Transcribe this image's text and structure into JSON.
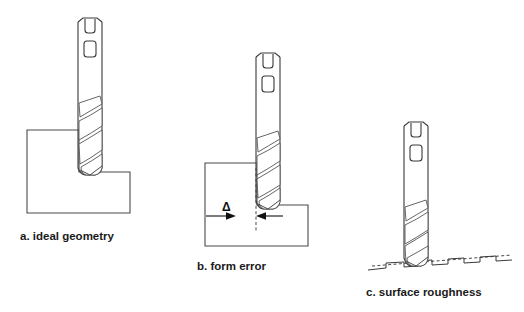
{
  "figure": {
    "background_color": "#ffffff",
    "line_color": "#4a4a4a",
    "text_color": "#1a1a1a"
  },
  "panels": [
    {
      "id": "a",
      "caption": "a. ideal geometry",
      "caption_x": 20,
      "caption_y": 240,
      "tool": {
        "name": "end-mill-cutter",
        "shank_x": 78,
        "shank_top": 18,
        "shank_width": 24,
        "flute_count": 3,
        "tip_y": 170
      },
      "workpiece": {
        "name": "stepped-workpiece",
        "shape": "L-step",
        "left": 27,
        "top": 130,
        "right": 130,
        "bottom": 213,
        "step_x": 79,
        "step_y": 172
      }
    },
    {
      "id": "b",
      "caption": "b. form error",
      "caption_x": 197,
      "caption_y": 270,
      "annotation": {
        "symbol": "Δ",
        "name": "form-error-delta",
        "symbol_x": 222,
        "symbol_y": 207,
        "dim_line_y": 216,
        "dim_left_x": 206,
        "dim_right_x": 283,
        "reference_line_x": 256
      },
      "tool": {
        "name": "end-mill-cutter",
        "shank_x": 256,
        "shank_top": 53,
        "shank_width": 24,
        "flute_count": 3,
        "tip_y": 205
      },
      "workpiece": {
        "name": "stepped-workpiece-with-error",
        "shape": "L-step",
        "left": 205,
        "top": 163,
        "right": 308,
        "bottom": 246,
        "step_x": 264,
        "step_y": 205
      }
    },
    {
      "id": "c",
      "caption": "c. surface roughness",
      "caption_x": 366,
      "caption_y": 296,
      "tool": {
        "name": "end-mill-cutter",
        "shank_x": 404,
        "shank_top": 122,
        "shank_width": 24,
        "flute_count": 3,
        "tip_y": 262
      },
      "surface": {
        "name": "rough-surface-profile",
        "left_x": 368,
        "right_x": 512,
        "baseline_left_y": 268,
        "baseline_right_y": 256,
        "tooth_count": 7,
        "tooth_depth": 5
      }
    }
  ]
}
